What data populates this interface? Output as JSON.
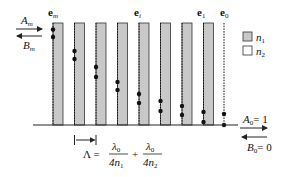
{
  "diagram": {
    "type": "multilayer-stack",
    "left_wave": {
      "forward": "A",
      "forward_sub": "m",
      "backward": "B",
      "backward_sub": "m"
    },
    "right_wave": {
      "forward": "A",
      "forward_sub": "0",
      "forward_eq": "= 1",
      "backward": "B",
      "backward_sub": "0",
      "backward_eq": "= 0"
    },
    "top_labels": [
      {
        "base": "e",
        "sub": "m"
      },
      {
        "base": "e",
        "sub": "i"
      },
      {
        "base": "e",
        "sub": "1"
      },
      {
        "base": "e",
        "sub": "0"
      }
    ],
    "legend": [
      {
        "symbol": "n",
        "sub": "1",
        "fill": "#c8c8c8"
      },
      {
        "symbol": "n",
        "sub": "2",
        "fill": "#ffffff"
      }
    ],
    "period": {
      "lhs": "Λ =",
      "term1_num": "λ",
      "term1_num_sub": "0",
      "term1_den": "4n",
      "term1_den_sub": "1",
      "plus": "+",
      "term2_num": "λ",
      "term2_num_sub": "0",
      "term2_den": "4n",
      "term2_den_sub": "2"
    },
    "layer_count": 8,
    "colors": {
      "layer_n1": "#c8c8c8",
      "layer_n2": "#ffffff",
      "line": "#222222"
    }
  }
}
